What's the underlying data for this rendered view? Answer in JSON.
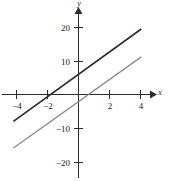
{
  "figure": {
    "name": "linear-functions-graph",
    "background_color": "#ffffff"
  },
  "axes": {
    "x_axis_label": "x",
    "y_axis_label": "y",
    "x_ticks": [
      {
        "value": -4,
        "label": "−4"
      },
      {
        "value": -2,
        "label": "−2"
      },
      {
        "value": 2,
        "label": "2"
      },
      {
        "value": 4,
        "label": "4"
      }
    ],
    "y_ticks": [
      {
        "value": 20,
        "label": "20"
      },
      {
        "value": 10,
        "label": "10"
      },
      {
        "value": -10,
        "label": "−10"
      },
      {
        "value": -20,
        "label": "−20"
      }
    ],
    "axis_color": "#2b2b2b"
  },
  "chart_data": {
    "type": "line",
    "title": "",
    "subtitle": "",
    "xlabel": "x",
    "ylabel": "y",
    "xlim": [
      -5.0,
      5.2
    ],
    "ylim": [
      -25.0,
      26.0
    ],
    "grid": false,
    "legend": "none",
    "x_ticks": [
      -4,
      -2,
      2,
      4
    ],
    "y_ticks": [
      20,
      10,
      -10,
      -20
    ],
    "x_tick_labels": [
      "−4",
      "−2",
      "2",
      "4"
    ],
    "y_tick_labels": [
      "20",
      "10",
      "−10",
      "−20"
    ],
    "series": [
      {
        "name": "upper-line",
        "color": "#2a2a2a",
        "slope": 3.33,
        "intercept": 6.0,
        "x_intercept": -1.8,
        "x": [
          -4.2,
          4.05
        ],
        "values": [
          -8.0,
          19.5
        ]
      },
      {
        "name": "lower-line",
        "color": "#8a8a8a",
        "slope": 3.28,
        "intercept": -2.1,
        "x_intercept": 0.64,
        "x": [
          -4.2,
          4.05
        ],
        "values": [
          -15.9,
          11.2
        ]
      }
    ],
    "annotations": []
  }
}
